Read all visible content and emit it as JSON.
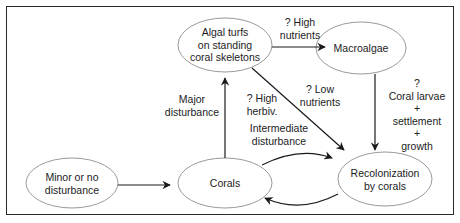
{
  "diagram": {
    "nodes": {
      "algal_turfs": {
        "label": "Algal turfs\non standing\ncoral skeletons"
      },
      "macroalgae": {
        "label": "Macroalgae"
      },
      "minor_disturbance": {
        "label": "Minor or no\ndisturbance"
      },
      "corals": {
        "label": "Corals"
      },
      "recolonization": {
        "label": "Recolonization\nby corals"
      }
    },
    "edges": {
      "high_nutrients": {
        "label": "? High\nnutrients",
        "from": "Algal turfs on standing coral skeletons",
        "to": "Macroalgae"
      },
      "low_nutrients": {
        "label": "? Low\nnutrients",
        "from": "Algal turfs on standing coral skeletons",
        "to": "Recolonization by corals"
      },
      "high_herbiv": {
        "label": "? High\nherbiv.",
        "from": "Algal turfs on standing coral skeletons",
        "to": "Recolonization by corals"
      },
      "major_disturbance": {
        "label": "Major\ndisturbance",
        "from": "Corals",
        "to": "Algal turfs on standing coral skeletons"
      },
      "coral_larvae": {
        "label": "?\nCoral larvae\n+\nsettlement\n+\ngrowth",
        "from": "Macroalgae",
        "to": "Recolonization by corals"
      },
      "intermediate_disturbance": {
        "label": "Intermediate\ndisturbance",
        "from": "Corals",
        "to": "Recolonization by corals"
      },
      "minor_to_corals": {
        "label": "",
        "from": "Minor or no disturbance",
        "to": "Corals"
      },
      "recolonization_to_corals": {
        "label": "",
        "from": "Recolonization by corals",
        "to": "Corals"
      }
    }
  }
}
